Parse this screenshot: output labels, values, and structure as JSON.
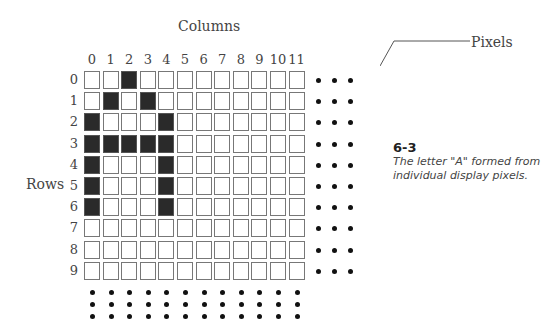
{
  "figure": {
    "columns_title": "Columns",
    "rows_title": "Rows",
    "pixels_label": "Pixels",
    "column_labels": [
      "0",
      "1",
      "2",
      "3",
      "4",
      "5",
      "6",
      "7",
      "8",
      "9",
      "10",
      "11"
    ],
    "row_labels": [
      "0",
      "1",
      "2",
      "3",
      "4",
      "5",
      "6",
      "7",
      "8",
      "9"
    ],
    "lit_pixels": [
      [
        0,
        2
      ],
      [
        1,
        1
      ],
      [
        1,
        3
      ],
      [
        2,
        0
      ],
      [
        2,
        4
      ],
      [
        3,
        0
      ],
      [
        3,
        1
      ],
      [
        3,
        2
      ],
      [
        3,
        3
      ],
      [
        3,
        4
      ],
      [
        4,
        0
      ],
      [
        4,
        4
      ],
      [
        5,
        0
      ],
      [
        5,
        4
      ],
      [
        6,
        0
      ],
      [
        6,
        4
      ]
    ],
    "caption_number": "6-3",
    "caption_text": "The letter \"A\" formed from individual display pixels."
  },
  "colors": {
    "lit": "#2a2a2a",
    "unlit": "#ffffff",
    "border": "#777777"
  }
}
